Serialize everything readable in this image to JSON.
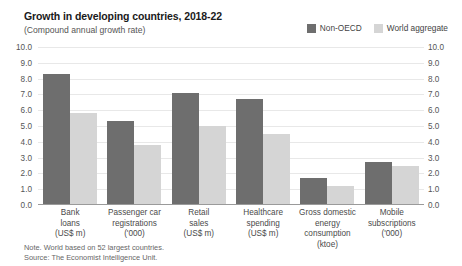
{
  "header": {
    "title": "Growth in developing countries, 2018-22",
    "subtitle": "(Compound annual growth rate)"
  },
  "legend": {
    "items": [
      {
        "label": "Non-OECD",
        "color": "#6e6e6e"
      },
      {
        "label": "World aggregate",
        "color": "#d5d5d5"
      }
    ]
  },
  "footnote": {
    "note": "Note. World based on 52 largest countries.",
    "source": "Source: The Economist Intelligence Unit."
  },
  "axis": {
    "ticks": [
      "10.0",
      "9.0",
      "8.0",
      "7.0",
      "6.0",
      "5.0",
      "4.0",
      "3.0",
      "2.0",
      "1.0",
      "0.0"
    ]
  },
  "chart_data": {
    "type": "bar",
    "title": "Growth in developing countries, 2018-22",
    "subtitle": "(Compound annual growth rate)",
    "xlabel": "",
    "ylabel": "",
    "ylim": [
      0,
      10
    ],
    "yticks": [
      0,
      1,
      2,
      3,
      4,
      5,
      6,
      7,
      8,
      9,
      10
    ],
    "grid": true,
    "legend_position": "top-right",
    "categories": [
      "Bank loans (US$ m)",
      "Passenger car registrations ('000)",
      "Retail sales (US$ m)",
      "Healthcare spending (US$ m)",
      "Gross domestic energy consumption (ktoe)",
      "Mobile subscriptions ('000)"
    ],
    "category_lines": [
      [
        "Bank",
        "loans",
        "(US$ m)"
      ],
      [
        "Passenger car",
        "registrations",
        "('000)"
      ],
      [
        "Retail",
        "sales",
        "(US$ m)"
      ],
      [
        "Healthcare",
        "spending",
        "(US$ m)"
      ],
      [
        "Gross domestic",
        "energy consumption",
        "(ktoe)"
      ],
      [
        "Mobile",
        "subscriptions",
        "('000)"
      ]
    ],
    "series": [
      {
        "name": "Non-OECD",
        "color": "#6e6e6e",
        "values": [
          8.3,
          5.3,
          7.1,
          6.7,
          1.7,
          2.7
        ]
      },
      {
        "name": "World aggregate",
        "color": "#d5d5d5",
        "values": [
          5.8,
          3.8,
          5.0,
          4.5,
          1.2,
          2.5
        ]
      }
    ]
  }
}
